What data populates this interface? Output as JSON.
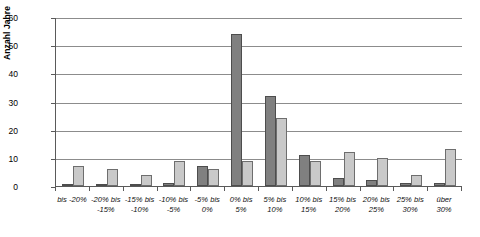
{
  "chart_data": {
    "type": "bar",
    "title": "",
    "xlabel": "",
    "ylabel": "Anzahl Jahre",
    "ylim": [
      0,
      60
    ],
    "yticks": [
      0,
      10,
      20,
      30,
      40,
      50,
      60
    ],
    "grid": true,
    "legend": "none",
    "categories": [
      "bis -20%",
      "-20% bis -15%",
      "-15% bis -10%",
      "-10% bis -5%",
      "-5% bis 0%",
      "0% bis 5%",
      "5% bis 10%",
      "10% bis 15%",
      "15% bis 20%",
      "20% bis 25%",
      "25% bis 30%",
      "über 30%"
    ],
    "category_lines": [
      [
        "bis -20%",
        ""
      ],
      [
        "-20% bis",
        "-15%"
      ],
      [
        "-15% bis",
        "-10%"
      ],
      [
        "-10% bis",
        "-5%"
      ],
      [
        "-5% bis",
        "0%"
      ],
      [
        "0% bis",
        "5%"
      ],
      [
        "5% bis",
        "10%"
      ],
      [
        "10% bis",
        "15%"
      ],
      [
        "15% bis",
        "20%"
      ],
      [
        "20% bis",
        "25%"
      ],
      [
        "25% bis",
        "30%"
      ],
      [
        "über",
        "30%"
      ]
    ],
    "series": [
      {
        "name": "series-dark",
        "color": "#808080",
        "values": [
          0,
          0,
          0,
          1,
          7,
          54,
          32,
          11,
          3,
          2,
          1,
          1
        ]
      },
      {
        "name": "series-light",
        "color": "#c9c9c9",
        "values": [
          7,
          6,
          4,
          9,
          6,
          9,
          24,
          9,
          12,
          10,
          4,
          13
        ]
      }
    ]
  },
  "colors": {
    "axis": "#5a5a5a",
    "grid": "#8c8c8c",
    "series_dark": "#808080",
    "series_light": "#c9c9c9",
    "background": "#ffffff"
  }
}
